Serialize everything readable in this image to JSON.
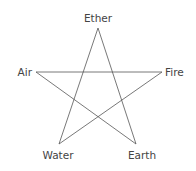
{
  "diagram": {
    "type": "pentagram",
    "line_color": "#555555",
    "text_color": "#444444",
    "nodes": [
      {
        "id": "ether",
        "label": "Ether",
        "x": 98,
        "y": 28,
        "lx": 98,
        "ly": 22,
        "anchor": "middle"
      },
      {
        "id": "fire",
        "label": "Fire",
        "x": 162,
        "y": 72,
        "lx": 165,
        "ly": 76,
        "anchor": "start"
      },
      {
        "id": "earth",
        "label": "Earth",
        "x": 136,
        "y": 144,
        "lx": 142,
        "ly": 159,
        "anchor": "middle"
      },
      {
        "id": "water",
        "label": "Water",
        "x": 59,
        "y": 144,
        "lx": 58,
        "ly": 159,
        "anchor": "middle"
      },
      {
        "id": "air",
        "label": "Air",
        "x": 36,
        "y": 72,
        "lx": 32,
        "ly": 76,
        "anchor": "end"
      }
    ],
    "edges": [
      [
        "ether",
        "earth"
      ],
      [
        "earth",
        "air"
      ],
      [
        "air",
        "fire"
      ],
      [
        "fire",
        "water"
      ],
      [
        "water",
        "ether"
      ]
    ]
  }
}
